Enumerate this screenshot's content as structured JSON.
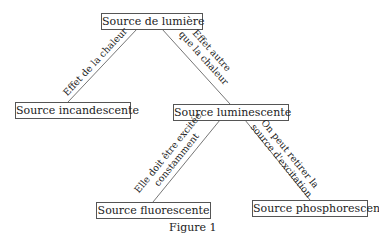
{
  "diagram": {
    "nodes": {
      "root": "Source de lumière",
      "incandescent": "Source incandescente",
      "luminescent": "Source luminescente",
      "fluorescent": "Source fluorescente",
      "phosphorescent": "Source phosphorescente"
    },
    "edges": {
      "root_incandescent": "Effet de la chaleur",
      "root_luminescent_line1": "Effet autre",
      "root_luminescent_line2": "que la chaleur",
      "lum_fluo_line1": "Elle doit être excitée",
      "lum_fluo_line2": "constamment",
      "lum_phospho_line1": "On peut retirer la",
      "lum_phospho_line2": "source d'excitation"
    },
    "caption": "Figure 1"
  }
}
